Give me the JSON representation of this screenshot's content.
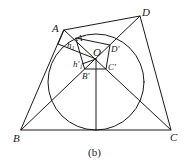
{
  "figure": {
    "caption": "(b)",
    "points": {
      "A": "A",
      "B": "B",
      "C": "C",
      "D": "D",
      "O": "O",
      "A_prime": "A′",
      "B_prime": "B′",
      "C_prime": "C′",
      "D_prime": "D′"
    },
    "heights": {
      "h1": "h",
      "h1_sub": "1",
      "h1_prime": "h′",
      "h1_prime_sub": "1"
    },
    "line_color": "#1a1a1a"
  }
}
